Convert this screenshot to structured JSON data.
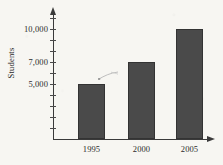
{
  "chart_data": {
    "type": "bar",
    "title": "",
    "subtitle": "",
    "xlabel": "",
    "ylabel": "Students",
    "categories": [
      "1995",
      "2000",
      "2005"
    ],
    "values": [
      5000,
      7000,
      10000
    ],
    "series": [
      {
        "name": "Students",
        "values": [
          5000,
          7000,
          10000
        ]
      }
    ],
    "ylim": [
      0,
      11000
    ],
    "y_tick_values": [
      1000,
      2000,
      3000,
      4000,
      5000,
      6000,
      7000,
      8000,
      9000,
      10000,
      11000
    ],
    "y_labeled_ticks": [
      {
        "value": 5000,
        "label": "5,000"
      },
      {
        "value": 7000,
        "label": "7,000"
      },
      {
        "value": 10000,
        "label": "10,000"
      }
    ],
    "grid": false,
    "legend": false,
    "legend_position": "none",
    "bar_color": "#4a4a4a",
    "bar_edge_color": "#333333",
    "axis_color": "#3a3a3a",
    "background_color": "#f7f6f2",
    "x_axis_has_arrow": true,
    "y_axis_has_arrow": true,
    "annotations": [
      {
        "name": "scan-artifact",
        "description": "faint curved scan mark above first bar"
      }
    ]
  }
}
